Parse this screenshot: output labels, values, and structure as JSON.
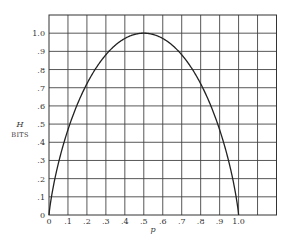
{
  "chart_data": {
    "type": "line",
    "title": "",
    "xlabel": "p",
    "ylabel": "H",
    "ylabel_unit": "BITS",
    "xlim": [
      0,
      1.2
    ],
    "ylim": [
      0,
      1.1
    ],
    "grid": true,
    "x_ticks": [
      0,
      0.1,
      0.2,
      0.3,
      0.4,
      0.5,
      0.6,
      0.7,
      0.8,
      0.9,
      1.0
    ],
    "x_tick_labels": [
      "0",
      ".1",
      ".2",
      ".3",
      ".4",
      ".5",
      ".6",
      ".7",
      ".8",
      ".9",
      "1.0"
    ],
    "y_ticks": [
      0,
      0.1,
      0.2,
      0.3,
      0.4,
      0.5,
      0.6,
      0.7,
      0.8,
      0.9,
      1.0
    ],
    "y_tick_labels": [
      "0",
      ".1",
      ".2",
      ".3",
      ".4",
      ".5",
      ".6",
      ".7",
      ".8",
      ".9",
      "1.0"
    ],
    "grid_x_step": 0.1,
    "grid_y_step": 0.1,
    "series": [
      {
        "name": "H(p)",
        "x": [
          0,
          0.01,
          0.02,
          0.05,
          0.1,
          0.15,
          0.2,
          0.25,
          0.3,
          0.35,
          0.4,
          0.45,
          0.5,
          0.55,
          0.6,
          0.65,
          0.7,
          0.75,
          0.8,
          0.85,
          0.9,
          0.95,
          0.98,
          0.99,
          1.0
        ],
        "y": [
          0,
          0.081,
          0.141,
          0.286,
          0.469,
          0.61,
          0.722,
          0.811,
          0.881,
          0.934,
          0.971,
          0.993,
          1.0,
          0.993,
          0.971,
          0.934,
          0.881,
          0.811,
          0.722,
          0.61,
          0.469,
          0.286,
          0.141,
          0.081,
          0
        ]
      }
    ]
  }
}
